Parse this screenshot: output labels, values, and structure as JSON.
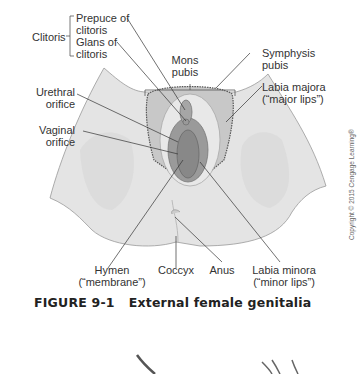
{
  "figure": {
    "number": "FIGURE 9-1",
    "title": "External female genitalia",
    "copyright": "Copyright © 2015 Cengage Learning®"
  },
  "labels": {
    "clitoris": "Clitoris",
    "prepuce_1": "Prepuce of",
    "prepuce_2": "clitoris",
    "glans_1": "Glans of",
    "glans_2": "clitoris",
    "mons_1": "Mons",
    "mons_2": "pubis",
    "symphysis_1": "Symphysis",
    "symphysis_2": "pubis",
    "labia_majora_1": "Labia majora",
    "labia_majora_2": "(“major lips”)",
    "urethral_1": "Urethral",
    "urethral_2": "orifice",
    "vaginal_1": "Vaginal",
    "vaginal_2": "orifice",
    "hymen_1": "Hymen",
    "hymen_2": "(“membrane”)",
    "coccyx": "Coccyx",
    "anus": "Anus",
    "labia_minora_1": "Labia minora",
    "labia_minora_2": "(“minor lips”)"
  },
  "colors": {
    "skin": "#e4e4e4",
    "skin_shadow": "#cfcfcf",
    "labia": "#9a9a9a",
    "labia_dark": "#7a7a7a",
    "leader_line": "#333333"
  }
}
